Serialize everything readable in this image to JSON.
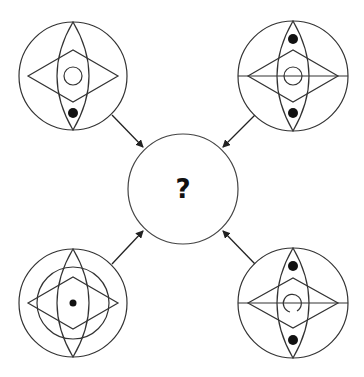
{
  "puzzle": {
    "center": {
      "label": "?",
      "cx": 183,
      "cy": 189,
      "r": 55
    },
    "stroke_color": "#333333",
    "fill_color": "#111111",
    "figures": [
      {
        "name": "top-left",
        "cx": 73,
        "cy": 76,
        "r": 54,
        "horizontal_line": false,
        "inner_ring": false,
        "small_circle": "full",
        "dots": [
          "bottom"
        ],
        "center_dot": false
      },
      {
        "name": "top-right",
        "cx": 293,
        "cy": 76,
        "r": 55,
        "horizontal_line": true,
        "inner_ring": false,
        "small_circle": "full",
        "dots": [
          "top",
          "bottom"
        ],
        "center_dot": false
      },
      {
        "name": "bottom-left",
        "cx": 73,
        "cy": 303,
        "r": 54,
        "horizontal_line": false,
        "inner_ring": true,
        "small_circle": "none",
        "dots": [],
        "center_dot": true
      },
      {
        "name": "bottom-right",
        "cx": 293,
        "cy": 303,
        "r": 55,
        "horizontal_line": true,
        "inner_ring": false,
        "small_circle": "broken",
        "dots": [
          "top",
          "bottom"
        ],
        "center_dot": false
      }
    ]
  }
}
